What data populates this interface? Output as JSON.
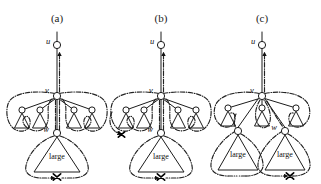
{
  "figure": {
    "type": "diagram",
    "title": "",
    "background": "#ffffff",
    "ink_color": "#1c1c1c",
    "width": 321,
    "height": 184,
    "panel_count": 3
  },
  "panels": [
    {
      "id": "a",
      "label": "(a)",
      "label_x": 57,
      "label_y": 18,
      "origin_x": 0,
      "nodes": [
        {
          "name": "u",
          "label": "u",
          "cx": 57,
          "cy": 45,
          "r": 3.6,
          "label_dx": -8,
          "label_dy": -2
        },
        {
          "name": "v",
          "label": "v",
          "cx": 57,
          "cy": 96,
          "r": 3.6,
          "label_dx": -9,
          "label_dy": -3
        },
        {
          "name": "w",
          "label": "w",
          "cx": 57,
          "cy": 133,
          "r": 3.6,
          "label_dx": -10,
          "label_dy": -2
        }
      ],
      "small_triangles": [
        {
          "apex_x": 22,
          "apex_y": 110,
          "half_w": 7.5,
          "base_y": 128
        },
        {
          "apex_x": 40,
          "apex_y": 110,
          "half_w": 7.5,
          "base_y": 128
        },
        {
          "apex_x": 74,
          "apex_y": 110,
          "half_w": 7.5,
          "base_y": 128
        },
        {
          "apex_x": 92,
          "apex_y": 110,
          "half_w": 7.5,
          "base_y": 128
        }
      ],
      "large_triangles": [
        {
          "label": "large",
          "apex_x": 57,
          "apex_y": 137,
          "half_w": 23,
          "base_y": 172,
          "text_y": 158
        }
      ],
      "x_marks": [
        {
          "cx": 57,
          "cy": 177,
          "size": 4.2
        }
      ]
    },
    {
      "id": "b",
      "label": "(b)",
      "label_x": 161,
      "label_y": 18,
      "origin_x": 104,
      "nodes": [
        {
          "name": "u",
          "label": "u",
          "cx": 161,
          "cy": 45,
          "r": 3.6,
          "label_dx": -8,
          "label_dy": -2
        },
        {
          "name": "v",
          "label": "v",
          "cx": 161,
          "cy": 96,
          "r": 3.6,
          "label_dx": -9,
          "label_dy": -3
        },
        {
          "name": "w",
          "label": "w",
          "cx": 161,
          "cy": 133,
          "r": 3.6,
          "label_dx": -10,
          "label_dy": -2
        }
      ],
      "small_triangles": [
        {
          "apex_x": 126,
          "apex_y": 110,
          "half_w": 7.5,
          "base_y": 128
        },
        {
          "apex_x": 144,
          "apex_y": 110,
          "half_w": 7.5,
          "base_y": 128
        },
        {
          "apex_x": 178,
          "apex_y": 110,
          "half_w": 7.5,
          "base_y": 128
        },
        {
          "apex_x": 196,
          "apex_y": 110,
          "half_w": 7.5,
          "base_y": 128
        }
      ],
      "large_triangles": [
        {
          "label": "large",
          "apex_x": 161,
          "apex_y": 137,
          "half_w": 23,
          "base_y": 172,
          "text_y": 158
        }
      ],
      "x_marks": [
        {
          "cx": 119,
          "cy": 134,
          "size": 4.2
        },
        {
          "cx": 161,
          "cy": 177,
          "size": 4.2
        }
      ]
    },
    {
      "id": "c",
      "label": "(c)",
      "label_x": 260,
      "label_y": 18,
      "origin_x": 211,
      "nodes": [
        {
          "name": "u",
          "label": "u",
          "cx": 262,
          "cy": 45,
          "r": 3.6,
          "label_dx": -8,
          "label_dy": -2
        },
        {
          "name": "v",
          "label": "v",
          "cx": 262,
          "cy": 96,
          "r": 3.6,
          "label_dx": -9,
          "label_dy": -3
        },
        {
          "name": "w",
          "label": "w",
          "cx": 285,
          "cy": 131,
          "r": 3.6,
          "label_dx": -10,
          "label_dy": -2
        },
        {
          "name": "w-left",
          "label": "",
          "cx": 238,
          "cy": 131,
          "r": 3.6,
          "label_dx": 0,
          "label_dy": 0
        }
      ],
      "small_triangles": [
        {
          "apex_x": 228,
          "apex_y": 108,
          "half_w": 7.5,
          "base_y": 126
        },
        {
          "apex_x": 262,
          "apex_y": 108,
          "half_w": 7.5,
          "base_y": 126
        },
        {
          "apex_x": 296,
          "apex_y": 108,
          "half_w": 7.5,
          "base_y": 126
        }
      ],
      "large_triangles": [
        {
          "label": "large",
          "apex_x": 238,
          "apex_y": 135,
          "half_w": 20,
          "base_y": 170,
          "text_y": 157
        },
        {
          "label": "large",
          "apex_x": 285,
          "apex_y": 135,
          "half_w": 20,
          "base_y": 170,
          "text_y": 157
        }
      ],
      "x_marks": [
        {
          "cx": 290,
          "cy": 176,
          "size": 4.2
        }
      ]
    }
  ],
  "legend": {
    "solid_edge_meaning": "tree edge",
    "dash_dot_route_meaning": "traversal route",
    "x_mark_meaning": "endpoint"
  },
  "text_tokens": {
    "u": "u",
    "v": "v",
    "w": "w",
    "large": "large",
    "panel_a": "(a)",
    "panel_b": "(b)",
    "panel_c": "(c)"
  }
}
